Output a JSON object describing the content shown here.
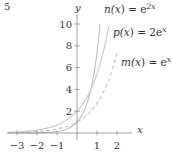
{
  "problem_number": "5",
  "chart_data": {
    "type": "line",
    "title": "",
    "xlabel": "x",
    "ylabel": "y",
    "xlim": [
      -3.5,
      2.3
    ],
    "ylim": [
      0,
      10.5
    ],
    "x_ticks": [
      -3,
      -2,
      -1,
      1,
      2
    ],
    "x_tick_labels": [
      "−3",
      "−2",
      "−1",
      "1",
      "2"
    ],
    "y_ticks": [
      2,
      4,
      6,
      8,
      10
    ],
    "y_tick_labels": [
      "2",
      "4",
      "6",
      "8",
      "10"
    ],
    "grid": false,
    "legend": "inline labels at right",
    "series": [
      {
        "name": "n(x) = e^{2x}",
        "label_base": "n(x) = e",
        "label_exp": "2x",
        "style": "solid",
        "color": "#bdbdbd",
        "x": [
          -3,
          -2,
          -1,
          0,
          0.5,
          1,
          1.15
        ],
        "values": [
          0.0025,
          0.018,
          0.135,
          1,
          2.72,
          7.39,
          9.97
        ]
      },
      {
        "name": "p(x) = 2e^{x}",
        "label_base": "p(x) = 2e",
        "label_exp": "x",
        "style": "solid",
        "color": "#c8c8c8",
        "x": [
          -3,
          -2,
          -1,
          0,
          1,
          1.5,
          1.6
        ],
        "values": [
          0.1,
          0.27,
          0.74,
          2,
          5.44,
          8.96,
          9.91
        ]
      },
      {
        "name": "m(x) = e^{x}",
        "label_base": "m(x) = e",
        "label_exp": "x",
        "style": "dashed",
        "color": "#c4c4c4",
        "x": [
          -3,
          -2,
          -1,
          0,
          1,
          2
        ],
        "values": [
          0.05,
          0.135,
          0.37,
          1,
          2.72,
          7.39
        ]
      }
    ]
  },
  "colors": {
    "axis": "#8a8a8a",
    "text": "#333333"
  }
}
